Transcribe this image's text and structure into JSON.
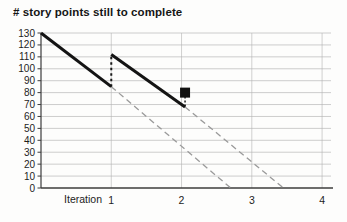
{
  "chart_data": {
    "type": "line",
    "title": "# story points still to complete",
    "xlabel": "Iteration",
    "x_ticks": [
      1,
      2,
      3,
      4
    ],
    "y_ticks": [
      0,
      10,
      20,
      30,
      40,
      50,
      60,
      70,
      80,
      90,
      100,
      110,
      120,
      130
    ],
    "xlim": [
      0,
      4.07
    ],
    "ylim": [
      0,
      130
    ],
    "grid": true,
    "legend_position": "none",
    "colors": {
      "line": "#141414",
      "projection": "#9a9a9a",
      "grid": "#b4b4b4",
      "axis": "#3c3c3c",
      "text": "#1d1d1d"
    },
    "series": [
      {
        "name": "projection-after-iteration-1",
        "style": "dashed",
        "color": "#9a9a9a",
        "points": [
          [
            1,
            85
          ],
          [
            2.7,
            0
          ]
        ]
      },
      {
        "name": "projection-after-iteration-2",
        "style": "dashed",
        "color": "#9a9a9a",
        "points": [
          [
            2.05,
            68
          ],
          [
            3.45,
            0
          ]
        ]
      },
      {
        "name": "scope-increase-at-iteration-1",
        "style": "dotted",
        "color": "#1a1a1a",
        "points": [
          [
            1,
            85
          ],
          [
            1,
            112
          ]
        ]
      },
      {
        "name": "iteration-1-burndown",
        "style": "solid-thick",
        "color": "#141414",
        "points": [
          [
            0,
            130
          ],
          [
            1,
            85
          ]
        ]
      },
      {
        "name": "iteration-2-burndown",
        "style": "solid-thick",
        "color": "#141414",
        "points": [
          [
            1,
            112
          ],
          [
            2.05,
            68
          ]
        ]
      }
    ],
    "marker": {
      "name": "actual-remaining-marker",
      "shape": "filled-square",
      "color": "#111111",
      "x": 2.05,
      "y": 80,
      "size": 10,
      "connector": "dotted-vertical-to-line",
      "connector_target_y": 68
    }
  }
}
